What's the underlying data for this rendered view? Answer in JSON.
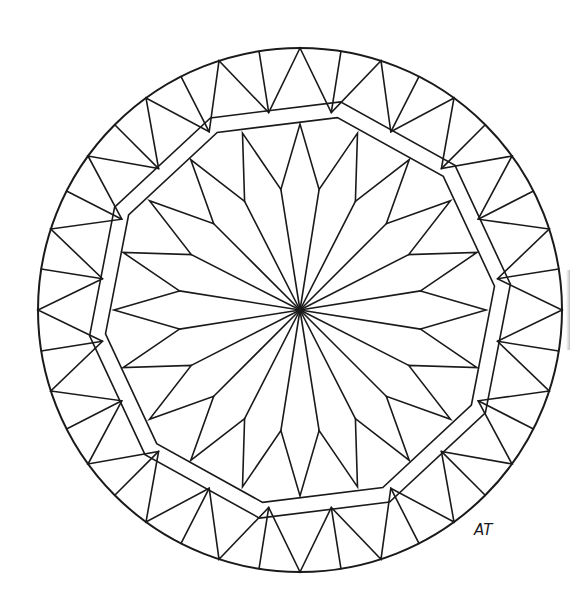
{
  "drawing": {
    "title": "Mandala coloring page",
    "signature": "AT",
    "line_color": "#1a1a1a",
    "background": "#ffffff",
    "center": [
      300,
      310
    ],
    "outer_circle_radius": 262,
    "triangle_ring": {
      "count": 20,
      "outer_radius": 262,
      "inner_radius": 200,
      "start_angle_deg": 0
    },
    "decagon_band": {
      "sides": 10,
      "outer_radius": 212,
      "inner_radius": 196,
      "rotation_deg": -7
    },
    "star": {
      "points": 20,
      "tip_radius": 186,
      "mid_radius": 122,
      "start_angle_deg": 0
    },
    "signature_position": [
      474,
      535
    ]
  }
}
